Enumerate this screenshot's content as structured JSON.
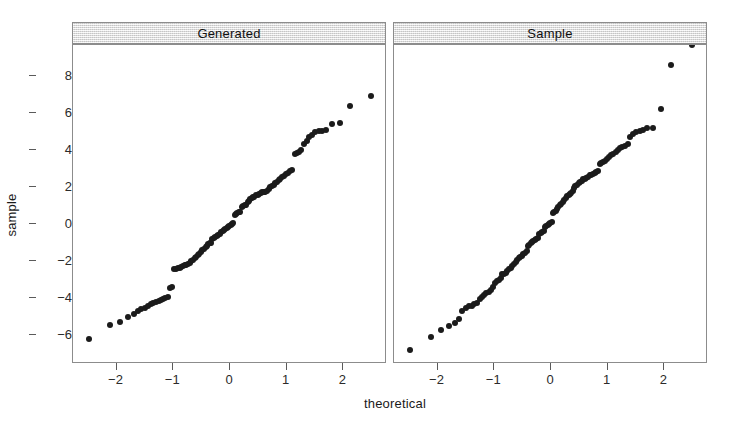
{
  "figure": {
    "xlabel": "theoretical",
    "ylabel": "sample",
    "point_color": "#1b1b1b",
    "frame_color": "#8c8c8c",
    "strip_fill": "#e4e4e4",
    "background": "#ffffff"
  },
  "chart_data": {
    "type": "scatter",
    "title": "",
    "subtitle": "",
    "xlabel": "theoretical",
    "ylabel": "sample",
    "grid": false,
    "legend": "none",
    "xlim": [
      -2.75,
      2.75
    ],
    "ylim": [
      -7.5,
      9.6
    ],
    "xticks": [
      -2,
      -1,
      0,
      1,
      2
    ],
    "xtick_labels": [
      "-2",
      "-1",
      "0",
      "1",
      "2"
    ],
    "yticks": [
      8,
      6,
      4,
      2,
      0,
      -2,
      -4,
      -6
    ],
    "ytick_labels": [
      "8",
      "6",
      "4",
      "2",
      "0",
      "-2",
      "-4",
      "-6"
    ],
    "panels": [
      {
        "label": "Generated",
        "x": [
          -2.48,
          -2.12,
          -1.94,
          -1.79,
          -1.7,
          -1.63,
          -1.57,
          -1.5,
          -1.45,
          -1.4,
          -1.35,
          -1.3,
          -1.26,
          -1.22,
          -1.18,
          -1.14,
          -1.1,
          -1.06,
          -1.03,
          -0.99,
          -0.96,
          -0.92,
          -0.89,
          -0.86,
          -0.83,
          -0.8,
          -0.77,
          -0.74,
          -0.71,
          -0.68,
          -0.65,
          -0.62,
          -0.6,
          -0.57,
          -0.54,
          -0.51,
          -0.49,
          -0.46,
          -0.43,
          -0.41,
          -0.38,
          -0.36,
          -0.33,
          -0.31,
          -0.28,
          -0.26,
          -0.23,
          -0.21,
          -0.18,
          -0.16,
          -0.13,
          -0.11,
          -0.08,
          -0.06,
          -0.03,
          -0.01,
          0.01,
          0.03,
          0.06,
          0.08,
          0.11,
          0.13,
          0.16,
          0.18,
          0.21,
          0.23,
          0.26,
          0.28,
          0.31,
          0.33,
          0.36,
          0.38,
          0.41,
          0.43,
          0.46,
          0.49,
          0.51,
          0.54,
          0.57,
          0.6,
          0.62,
          0.65,
          0.68,
          0.71,
          0.74,
          0.77,
          0.8,
          0.83,
          0.86,
          0.89,
          0.92,
          0.96,
          0.99,
          1.03,
          1.06,
          1.1,
          1.14,
          1.18,
          1.22,
          1.26,
          1.3,
          1.35,
          1.4,
          1.45,
          1.5,
          1.57,
          1.63,
          1.7,
          1.79,
          1.94,
          2.12,
          2.48
        ],
        "y": [
          -6.2,
          -5.45,
          -5.3,
          -5.0,
          -4.85,
          -4.72,
          -4.6,
          -4.52,
          -4.42,
          -4.3,
          -4.26,
          -4.2,
          -4.16,
          -4.1,
          -4.05,
          -4.0,
          -3.96,
          -3.45,
          -3.4,
          -2.45,
          -2.42,
          -2.4,
          -2.36,
          -2.32,
          -2.28,
          -2.24,
          -2.2,
          -2.15,
          -2.08,
          -2.0,
          -1.92,
          -1.84,
          -1.76,
          -1.68,
          -1.6,
          -1.5,
          -1.42,
          -1.34,
          -1.25,
          -1.18,
          -1.1,
          -1.05,
          -1.0,
          -0.8,
          -0.75,
          -0.7,
          -0.64,
          -0.58,
          -0.52,
          -0.46,
          -0.4,
          -0.34,
          -0.28,
          -0.22,
          -0.16,
          -0.1,
          -0.05,
          0.0,
          0.05,
          0.5,
          0.55,
          0.6,
          0.62,
          0.65,
          0.9,
          0.95,
          1.0,
          1.05,
          1.2,
          1.26,
          1.32,
          1.38,
          1.44,
          1.48,
          1.55,
          1.58,
          1.62,
          1.65,
          1.7,
          1.72,
          1.75,
          1.8,
          1.9,
          1.98,
          2.05,
          2.12,
          2.2,
          2.28,
          2.36,
          2.44,
          2.52,
          2.6,
          2.68,
          2.76,
          2.85,
          2.92,
          3.8,
          3.85,
          3.9,
          4.0,
          4.3,
          4.5,
          4.7,
          4.8,
          4.95,
          5.0,
          5.0,
          5.05,
          5.4,
          5.45,
          6.35,
          6.9
        ],
        "n": 112
      },
      {
        "label": "Sample",
        "x": [
          -2.48,
          -2.12,
          -1.94,
          -1.79,
          -1.7,
          -1.63,
          -1.57,
          -1.5,
          -1.45,
          -1.4,
          -1.35,
          -1.3,
          -1.26,
          -1.22,
          -1.18,
          -1.14,
          -1.1,
          -1.06,
          -1.03,
          -0.99,
          -0.96,
          -0.92,
          -0.89,
          -0.86,
          -0.83,
          -0.8,
          -0.77,
          -0.74,
          -0.71,
          -0.68,
          -0.65,
          -0.62,
          -0.6,
          -0.57,
          -0.54,
          -0.51,
          -0.49,
          -0.46,
          -0.43,
          -0.41,
          -0.38,
          -0.36,
          -0.33,
          -0.31,
          -0.28,
          -0.26,
          -0.23,
          -0.21,
          -0.18,
          -0.16,
          -0.13,
          -0.11,
          -0.08,
          -0.06,
          -0.03,
          -0.01,
          0.01,
          0.03,
          0.06,
          0.08,
          0.11,
          0.13,
          0.16,
          0.18,
          0.21,
          0.23,
          0.26,
          0.28,
          0.31,
          0.33,
          0.36,
          0.38,
          0.41,
          0.43,
          0.46,
          0.49,
          0.51,
          0.54,
          0.57,
          0.6,
          0.62,
          0.65,
          0.68,
          0.71,
          0.74,
          0.77,
          0.8,
          0.83,
          0.86,
          0.89,
          0.92,
          0.96,
          0.99,
          1.03,
          1.06,
          1.1,
          1.14,
          1.18,
          1.22,
          1.26,
          1.3,
          1.35,
          1.4,
          1.45,
          1.5,
          1.57,
          1.63,
          1.7,
          1.79,
          1.94,
          2.12,
          2.48
        ],
        "y": [
          -6.8,
          -6.1,
          -5.7,
          -5.5,
          -5.35,
          -5.1,
          -4.7,
          -4.55,
          -4.45,
          -4.4,
          -4.3,
          -4.25,
          -4.05,
          -3.95,
          -3.85,
          -3.75,
          -3.65,
          -3.55,
          -3.4,
          -3.2,
          -3.1,
          -3.0,
          -2.9,
          -2.72,
          -2.68,
          -2.62,
          -2.55,
          -2.45,
          -2.35,
          -2.25,
          -2.15,
          -2.05,
          -1.95,
          -1.85,
          -1.8,
          -1.72,
          -1.64,
          -1.56,
          -1.48,
          -1.2,
          -1.12,
          -1.05,
          -0.98,
          -0.92,
          -0.85,
          -0.8,
          -0.74,
          -0.55,
          -0.5,
          -0.45,
          -0.4,
          -0.15,
          -0.1,
          -0.05,
          0.0,
          0.05,
          0.1,
          0.6,
          0.65,
          0.7,
          0.8,
          0.9,
          1.0,
          1.1,
          1.2,
          1.3,
          1.4,
          1.5,
          1.55,
          1.6,
          1.68,
          1.8,
          1.95,
          2.05,
          2.12,
          2.2,
          2.25,
          2.3,
          2.4,
          2.45,
          2.5,
          2.56,
          2.62,
          2.66,
          2.7,
          2.74,
          2.78,
          2.85,
          3.25,
          3.3,
          3.35,
          3.4,
          3.5,
          3.6,
          3.7,
          3.8,
          3.9,
          4.0,
          4.1,
          4.15,
          4.2,
          4.3,
          4.7,
          4.85,
          4.95,
          5.0,
          5.05,
          5.15,
          5.2,
          6.2,
          8.6
        ],
        "n": 111
      }
    ]
  }
}
